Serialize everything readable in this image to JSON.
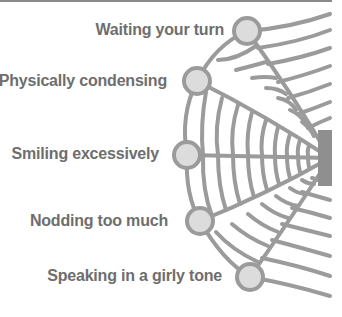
{
  "diagram": {
    "type": "spider-web",
    "colors": {
      "line": "#9b9b9b",
      "node_fill": "#dcdcdc",
      "node_stroke": "#9b9b9b",
      "text": "#6e6e6e",
      "center": "#8f8f8f"
    },
    "nodes": [
      {
        "label": "Waiting your turn"
      },
      {
        "label": "Physically condensing"
      },
      {
        "label": "Smiling excessively"
      },
      {
        "label": "Nodding too much"
      },
      {
        "label": "Speaking in a girly tone"
      }
    ]
  }
}
